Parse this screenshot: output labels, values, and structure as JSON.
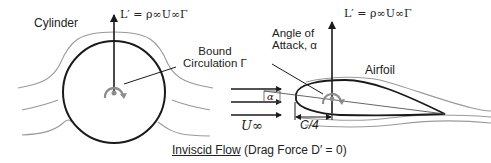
{
  "cylinder": {
    "label": "Cylinder",
    "lift_label": "L′ = ρ∞U∞Γ"
  },
  "airfoil": {
    "label": "Airfoil",
    "lift_label": "L′ = ρ∞U∞Γ",
    "angle_label_line1": "Angle of",
    "angle_label_line2": "Attack, α",
    "alpha_symbol": "α",
    "chord_label": "C/4"
  },
  "circulation": {
    "line1": "Bound",
    "line2": "Circulation Γ"
  },
  "freestream": {
    "label": "U∞"
  },
  "caption": {
    "underlined": "Inviscid Flow",
    "rest": " (Drag Force D′ = 0)"
  },
  "colors": {
    "body_stroke": "#1a1a1a",
    "streamline": "#9a9a9a",
    "vortex": "#8c8c8c"
  }
}
